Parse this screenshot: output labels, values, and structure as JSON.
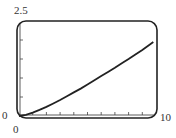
{
  "chart_data": {
    "type": "line",
    "title": "",
    "xlabel": "",
    "ylabel": "",
    "xlim": [
      0,
      10
    ],
    "ylim": [
      0,
      2.5
    ],
    "grid": false,
    "legend": null,
    "x_ticks": [
      1,
      2,
      3,
      4,
      5,
      6,
      7,
      8,
      9
    ],
    "y_ticks": [
      0.5,
      1.0,
      1.5,
      2.0
    ],
    "axis_labels": {
      "x_min": "0",
      "x_max": "10",
      "y_min": "0",
      "y_max": "2.5"
    },
    "series": [
      {
        "name": "f(x)",
        "x": [
          0,
          0.5,
          1,
          1.5,
          2,
          2.5,
          3,
          3.5,
          4,
          4.5,
          5,
          5.5,
          6,
          6.5,
          7,
          7.5,
          8,
          8.5,
          9,
          9.5,
          9.8
        ],
        "values": [
          0,
          0.03,
          0.09,
          0.16,
          0.24,
          0.33,
          0.42,
          0.52,
          0.62,
          0.72,
          0.83,
          0.94,
          1.05,
          1.16,
          1.27,
          1.39,
          1.5,
          1.62,
          1.74,
          1.87,
          1.95
        ]
      }
    ],
    "style": {
      "frame": "rounded-rectangle",
      "line_color": "#222222",
      "frame_color": "#222222"
    }
  }
}
